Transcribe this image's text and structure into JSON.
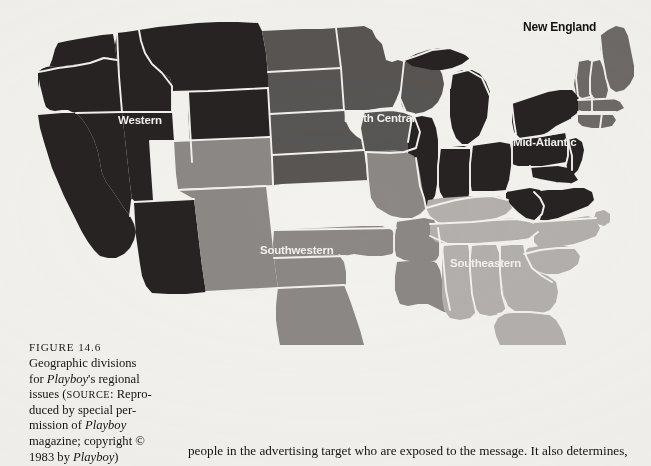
{
  "figure": {
    "number_label": "FIGURE 14.6",
    "caption_lines": [
      "Geographic divisions",
      "for Playboy's regional",
      "issues (SOURCE: Repro-",
      "duced by special per-",
      "mission of Playboy",
      "magazine; copyright ©",
      "1983 by Playboy)"
    ]
  },
  "body_text": {
    "line": "people in the advertising target who are exposed to the message. It also determines,"
  },
  "map": {
    "title": "Geographic divisions for Playboy's regional issues",
    "background_color": "#f4f2ee",
    "border_color": "#f3f1ee",
    "regions": [
      {
        "id": "western",
        "label": "Western",
        "color": "#262322",
        "label_color": "#f3f1ee",
        "label_x": 118,
        "label_y": 114,
        "states": [
          "Washington",
          "Oregon",
          "Idaho",
          "Montana",
          "Wyoming",
          "California",
          "Nevada",
          "Utah",
          "Arizona"
        ]
      },
      {
        "id": "north-central",
        "label": "North Central",
        "color": "#585553",
        "label_color": "#f3f1ee",
        "label_x": 344,
        "label_y": 112,
        "states": [
          "North Dakota",
          "South Dakota",
          "Nebraska",
          "Kansas",
          "Minnesota",
          "Iowa",
          "Wisconsin"
        ]
      },
      {
        "id": "mid-atlantic",
        "label": "Mid-Atlantic",
        "color": "#262322",
        "label_color": "#f3f1ee",
        "label_x": 516,
        "label_y": 136,
        "states": [
          "New York",
          "Pennsylvania",
          "New Jersey",
          "Maryland",
          "Delaware",
          "Virginia",
          "West Virginia",
          "Ohio",
          "Indiana",
          "Illinois",
          "Michigan"
        ]
      },
      {
        "id": "new-england",
        "label": "New England",
        "color": "#6d6a67",
        "label_color": "#14120f",
        "label_x": 523,
        "label_y": 20,
        "states": [
          "Maine",
          "New Hampshire",
          "Vermont",
          "Massachusetts",
          "Rhode Island",
          "Connecticut"
        ]
      },
      {
        "id": "southwestern",
        "label": "Southwestern",
        "color": "#8b8885",
        "label_color": "#f3f1ee",
        "label_x": 261,
        "label_y": 245,
        "states": [
          "Colorado",
          "New Mexico",
          "Texas",
          "Oklahoma",
          "Arkansas",
          "Louisiana",
          "Missouri"
        ]
      },
      {
        "id": "southeastern",
        "label": "Southeastern",
        "color": "#b3b0ad",
        "label_color": "#f3f1ee",
        "label_x": 451,
        "label_y": 257,
        "states": [
          "Kentucky",
          "Tennessee",
          "North Carolina",
          "South Carolina",
          "Georgia",
          "Alabama",
          "Mississippi",
          "Florida"
        ]
      }
    ]
  }
}
